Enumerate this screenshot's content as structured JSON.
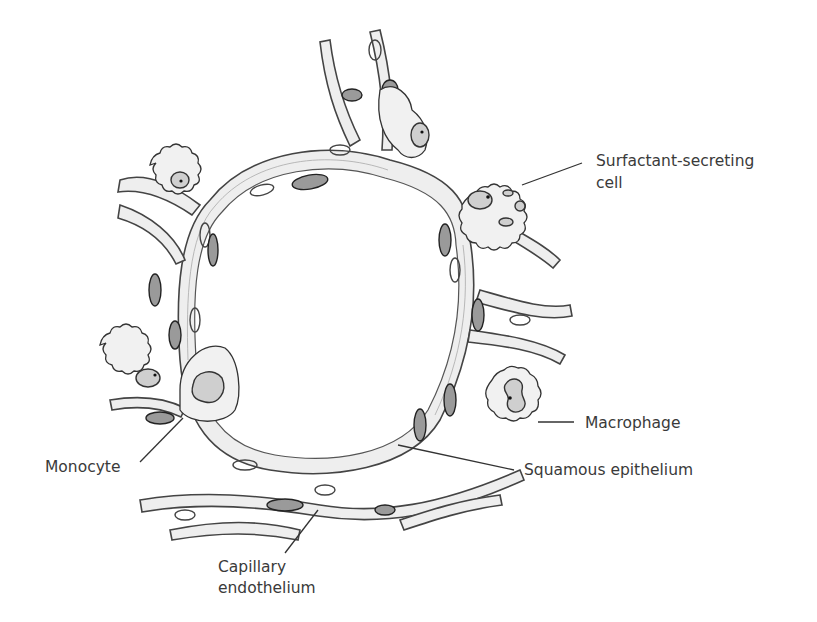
{
  "figure": {
    "labels": {
      "surfactant": [
        "Surfactant-secreting",
        "cell"
      ],
      "macrophage": "Macrophage",
      "squamous": "Squamous epithelium",
      "monocyte": "Monocyte",
      "capillary": [
        "Capillary",
        "endothelium"
      ]
    }
  }
}
